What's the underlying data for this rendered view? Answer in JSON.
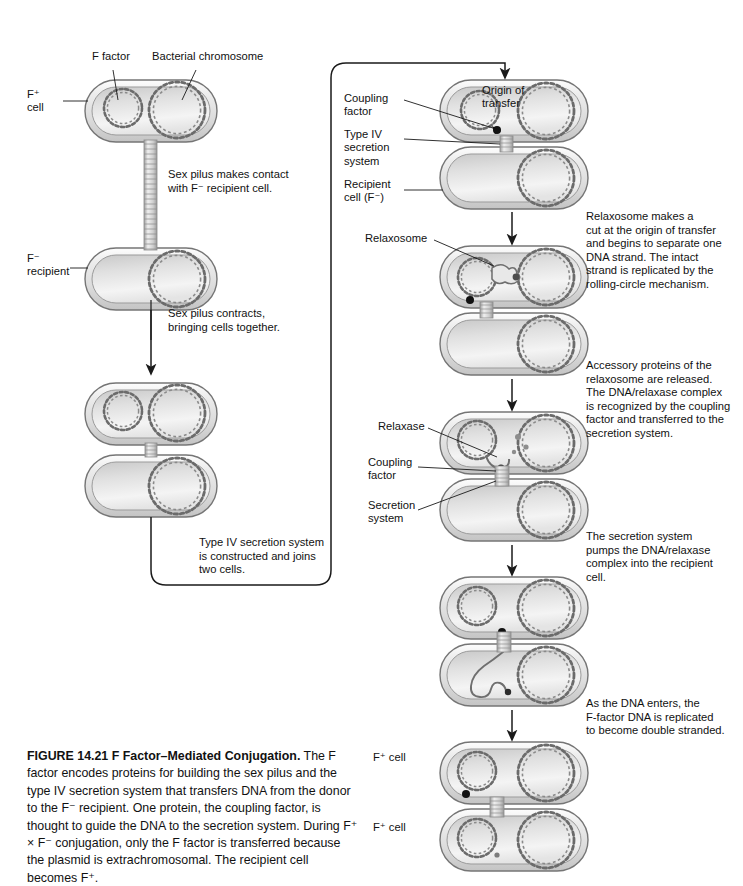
{
  "figure": {
    "number": "FIGURE 14.21",
    "title": "F Factor–Mediated Conjugation.",
    "caption_rest": " The F factor encodes proteins for building the sex pilus and the type IV secretion system that transfers DNA from the donor to the F⁻ recipient. One protein, the coupling factor, is thought to guide the DNA to the secretion system. During F⁺ × F⁻ conjugation, only the F factor is transferred because the plasmid is extrachromosomal. The recipient cell becomes F⁺."
  },
  "left_column": {
    "labels": [
      {
        "name": "f-factor",
        "text": "F factor",
        "x": 92,
        "y": 57
      },
      {
        "name": "bacterial-chromosome",
        "text": "Bacterial chromosome",
        "x": 152,
        "y": 57
      },
      {
        "name": "f-plus-cell",
        "text": "F⁺\ncell",
        "x": 31,
        "y": 93
      },
      {
        "name": "f-minus-recipient",
        "text": "F⁻\nrecipient",
        "x": 31,
        "y": 255
      }
    ],
    "steps": [
      {
        "name": "step-sex-pilus-contact",
        "text": "Sex pilus makes contact\nwith F⁻ recipient cell.",
        "x": 168,
        "y": 172
      },
      {
        "name": "step-sex-pilus-contracts",
        "text": "Sex pilus contracts,\nbringing cells together.",
        "x": 168,
        "y": 311
      },
      {
        "name": "step-type-iv-constructed",
        "text": "Type IV secretion system\nis constructed and joins\ntwo cells.",
        "x": 199,
        "y": 539
      }
    ]
  },
  "right_column": {
    "labels": [
      {
        "name": "coupling-factor",
        "text": "Coupling\nfactor",
        "x": 344,
        "y": 96
      },
      {
        "name": "origin-of-transfer",
        "text": "Origin of\ntransfer",
        "x": 482,
        "y": 88
      },
      {
        "name": "type-iv-secretion-system",
        "text": "Type IV\nsecretion\nsystem",
        "x": 344,
        "y": 132
      },
      {
        "name": "recipient-cell",
        "text": "Recipient\ncell (F⁻)",
        "x": 344,
        "y": 182
      },
      {
        "name": "relaxosome",
        "text": "Relaxosome",
        "x": 365,
        "y": 236
      },
      {
        "name": "relaxase",
        "text": "Relaxase",
        "x": 378,
        "y": 424
      },
      {
        "name": "coupling-factor-2",
        "text": "Coupling\nfactor",
        "x": 368,
        "y": 460
      },
      {
        "name": "secretion-system",
        "text": "Secretion\nsystem",
        "x": 368,
        "y": 503
      },
      {
        "name": "f-plus-cell-top",
        "text": "F⁺ cell",
        "x": 373,
        "y": 755
      },
      {
        "name": "f-plus-cell-bottom",
        "text": "F⁺ cell",
        "x": 373,
        "y": 825
      }
    ],
    "steps": [
      {
        "name": "step-relaxosome-cut",
        "text": "Relaxosome makes a\ncut at the origin of transfer\nand begins to separate one\nDNA strand. The intact\nstrand is replicated by the\nrolling-circle mechanism.",
        "x": 586,
        "y": 213
      },
      {
        "name": "step-accessory-proteins",
        "text": "Accessory proteins of the\nrelaxosome are released.\nThe DNA/relaxase complex\nis recognized by the coupling\nfactor and transferred to the\nsecretion system.",
        "x": 586,
        "y": 362
      },
      {
        "name": "step-secretion-pumps",
        "text": "The secretion system\npumps the DNA/relaxase\ncomplex into the recipient\ncell.",
        "x": 586,
        "y": 533
      },
      {
        "name": "step-dna-enters",
        "text": "As the DNA enters, the\nF-factor DNA is replicated\nto become double stranded.",
        "x": 586,
        "y": 700
      }
    ]
  },
  "diagram": {
    "cell_fill_light": "#f2f2f2",
    "cell_fill_mid": "#d9d9d9",
    "cell_fill_dark": "#b5b5b5",
    "cell_outline": "#6e6e6e",
    "dna_outline": "#6b6b6b",
    "arrow_color": "#1a1a1a",
    "dot_color": "#111111",
    "cells": [
      {
        "name": "cell-donor-1",
        "x": 85,
        "y": 80,
        "w": 132,
        "h": 62
      },
      {
        "name": "cell-recipient-1",
        "x": 85,
        "y": 248,
        "w": 132,
        "h": 62
      },
      {
        "name": "cell-donor-2",
        "x": 85,
        "y": 383,
        "w": 132,
        "h": 62
      },
      {
        "name": "cell-recipient-2",
        "x": 85,
        "y": 455,
        "w": 132,
        "h": 62
      },
      {
        "name": "cell-donor-3",
        "x": 440,
        "y": 80,
        "w": 148,
        "h": 62
      },
      {
        "name": "cell-recipient-3",
        "x": 440,
        "y": 147,
        "w": 148,
        "h": 62
      },
      {
        "name": "cell-donor-4",
        "x": 440,
        "y": 246,
        "w": 148,
        "h": 62
      },
      {
        "name": "cell-recipient-4",
        "x": 440,
        "y": 313,
        "w": 148,
        "h": 62
      },
      {
        "name": "cell-donor-5",
        "x": 440,
        "y": 412,
        "w": 148,
        "h": 62
      },
      {
        "name": "cell-recipient-5",
        "x": 440,
        "y": 479,
        "w": 148,
        "h": 62
      },
      {
        "name": "cell-donor-6",
        "x": 440,
        "y": 577,
        "w": 148,
        "h": 62
      },
      {
        "name": "cell-recipient-6",
        "x": 440,
        "y": 644,
        "w": 148,
        "h": 62
      },
      {
        "name": "cell-donor-7",
        "x": 440,
        "y": 742,
        "w": 148,
        "h": 62
      },
      {
        "name": "cell-recipient-7",
        "x": 440,
        "y": 809,
        "w": 148,
        "h": 62
      }
    ]
  }
}
